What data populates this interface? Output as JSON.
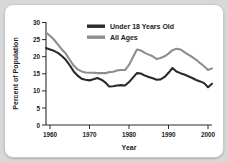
{
  "chart_data": {
    "type": "line",
    "title": "",
    "xlabel": "Year",
    "ylabel": "Percent of Population",
    "xlim": [
      1959,
      2001
    ],
    "ylim": [
      0,
      30
    ],
    "xticks": [
      1960,
      1970,
      1980,
      1990,
      2000
    ],
    "yticks": [
      0,
      5,
      10,
      15,
      20,
      25,
      30
    ],
    "grid": false,
    "legend_position": "top-center",
    "colors": {
      "under18": "#2a2a2a",
      "all_ages": "#8e8e8e"
    },
    "x": [
      1959,
      1960,
      1961,
      1962,
      1963,
      1964,
      1965,
      1966,
      1967,
      1968,
      1969,
      1970,
      1971,
      1972,
      1973,
      1974,
      1975,
      1976,
      1977,
      1978,
      1979,
      1980,
      1981,
      1982,
      1983,
      1984,
      1985,
      1986,
      1987,
      1988,
      1989,
      1990,
      1991,
      1992,
      1993,
      1994,
      1995,
      1996,
      1997,
      1998,
      1999,
      2000,
      2001
    ],
    "series": [
      {
        "name": "Under 18 Years Old",
        "color": "#2a2a2a",
        "values": [
          22.4,
          22.0,
          21.6,
          21.0,
          20.1,
          19.0,
          17.4,
          15.6,
          14.4,
          13.5,
          13.2,
          13.0,
          13.3,
          13.7,
          13.2,
          12.4,
          11.2,
          11.3,
          11.5,
          11.6,
          11.5,
          12.5,
          13.8,
          15.1,
          15.0,
          14.4,
          14.0,
          13.6,
          13.2,
          13.3,
          14.0,
          15.2,
          16.6,
          15.6,
          15.1,
          14.7,
          14.2,
          13.7,
          13.1,
          12.7,
          12.2,
          11.0,
          12.0
        ]
      },
      {
        "name": "All Ages",
        "color": "#8e8e8e",
        "values": [
          26.9,
          26.0,
          24.9,
          23.5,
          22.0,
          20.8,
          19.0,
          17.3,
          16.2,
          15.6,
          15.3,
          15.2,
          15.2,
          15.1,
          15.1,
          15.1,
          15.4,
          15.5,
          15.9,
          16.0,
          16.0,
          17.5,
          19.7,
          22.0,
          21.7,
          21.0,
          20.5,
          20.0,
          19.2,
          19.5,
          20.0,
          20.8,
          21.8,
          22.2,
          22.0,
          21.2,
          20.5,
          19.8,
          19.0,
          18.0,
          17.1,
          16.0,
          16.5
        ]
      }
    ]
  },
  "legend": {
    "items": [
      {
        "label": "Under 18 Years Old",
        "swatch": "swatch-a"
      },
      {
        "label": "All Ages",
        "swatch": "swatch-b"
      }
    ]
  },
  "axes": {
    "y_title": "Percent of Population",
    "x_title": "Year",
    "y_ticks": [
      "30",
      "25",
      "20",
      "15",
      "10",
      "5",
      "0"
    ],
    "x_ticks": [
      "1960",
      "1970",
      "1980",
      "1990",
      "2000"
    ]
  }
}
